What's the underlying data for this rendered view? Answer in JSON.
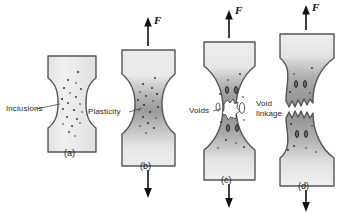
{
  "figure": {
    "title_present": false,
    "background_color": "#ffffff",
    "outline_color": "#4a4a4a",
    "body_fill_light": "#ededed",
    "body_fill_dark": "#8c8c8c",
    "inclusion_color": "#2e2e2e",
    "void_fill": "#ffffff"
  },
  "force_labels": [
    {
      "id": "force-b",
      "text": "F",
      "direction": "up"
    },
    {
      "id": "force-c",
      "text": "F",
      "direction": "up"
    },
    {
      "id": "force-d",
      "text": "F",
      "direction": "up"
    }
  ],
  "annotations": [
    {
      "id": "inclusions",
      "text": "Inclusions",
      "lines": [
        "Inclusions"
      ],
      "panel": "a"
    },
    {
      "id": "plasticity",
      "text": "Plasticity",
      "lines": [
        "Plasticity"
      ],
      "panel": "b"
    },
    {
      "id": "voids",
      "text": "Voids",
      "lines": [
        "Voids"
      ],
      "panel": "c"
    },
    {
      "id": "void-linkage",
      "text": "Void linkage",
      "lines": [
        "Void",
        "linkage"
      ],
      "panel": "d"
    }
  ],
  "panels": [
    {
      "id": "a",
      "label": "(a)",
      "stage": "inclusions present, no load",
      "has_force_arrows": false,
      "necking": "none",
      "shading": "uniform light",
      "voids": 0
    },
    {
      "id": "b",
      "label": "(b)",
      "stage": "plastic deformation, necking begins",
      "has_force_arrows": true,
      "necking": "slight",
      "shading": "dark band at neck",
      "voids": 0
    },
    {
      "id": "c",
      "label": "(c)",
      "stage": "void nucleation and growth at neck",
      "has_force_arrows": true,
      "necking": "pronounced",
      "shading": "dark band at neck",
      "voids": 5
    },
    {
      "id": "d",
      "label": "(d)",
      "stage": "void linkage and fracture separation",
      "has_force_arrows": true,
      "necking": "fractured",
      "shading": "dark band at fracture",
      "voids": 0
    }
  ]
}
